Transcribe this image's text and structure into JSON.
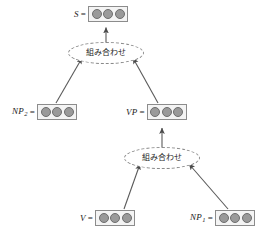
{
  "diagram": {
    "colors": {
      "background": "#ffffff",
      "circle_fill": "#9a9a9a",
      "circle_stroke": "#6e6e6e",
      "box_border": "#8c8c8c",
      "box_fill": "#f4f4f4",
      "arrow": "#555555",
      "dashed_border": "#8a8a8a",
      "text": "#1a1a1a"
    },
    "equals_sign": "=",
    "vector_cells": 3,
    "nodes": [
      {
        "id": "s",
        "label": "S",
        "subscript": "",
        "cells": 3
      },
      {
        "id": "np2",
        "label": "NP",
        "subscript": "2",
        "cells": 3
      },
      {
        "id": "vp",
        "label": "VP",
        "subscript": "",
        "cells": 3
      },
      {
        "id": "v",
        "label": "V",
        "subscript": "",
        "cells": 3
      },
      {
        "id": "np1",
        "label": "NP",
        "subscript": "1",
        "cells": 3
      }
    ],
    "operators": [
      {
        "id": "op-top",
        "label": "組み合わせ"
      },
      {
        "id": "op-bottom",
        "label": "組み合わせ"
      }
    ],
    "edges": [
      {
        "from": "op-top",
        "to": "s",
        "style": "arrow"
      },
      {
        "from": "np2",
        "to": "op-top",
        "style": "arrow"
      },
      {
        "from": "vp",
        "to": "op-top",
        "style": "arrow"
      },
      {
        "from": "op-bottom",
        "to": "vp",
        "style": "arrow"
      },
      {
        "from": "v",
        "to": "op-bottom",
        "style": "arrow"
      },
      {
        "from": "np1",
        "to": "op-bottom",
        "style": "arrow"
      }
    ]
  }
}
